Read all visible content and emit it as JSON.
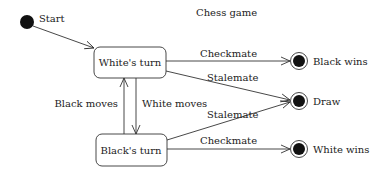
{
  "title": "Chess game",
  "initial_state": {
    "label": "Start"
  },
  "states": {
    "white_turn": "White's turn",
    "black_turn": "Black's turn"
  },
  "final_states": {
    "black_wins": "Black wins",
    "draw": "Draw",
    "white_wins": "White wins"
  },
  "transitions": {
    "white_checkmate": "Checkmate",
    "white_stalemate": "Stalemate",
    "black_stalemate": "Stalemate",
    "black_checkmate": "Checkmate",
    "black_moves": "Black moves",
    "white_moves": "White moves"
  },
  "colors": {
    "stroke": "#333333",
    "fill_dark": "#111111"
  }
}
